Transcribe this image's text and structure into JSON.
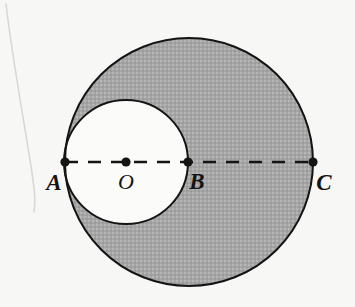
{
  "figure": {
    "background_color": "#f7f7f6",
    "stroke_color": "#141414",
    "shaded_fill_color": "#a8a8a8",
    "unshaded_fill_color": "#fbfbfa",
    "labels": {
      "a": "A",
      "o": "O",
      "b": "B",
      "c": "C"
    },
    "points": [
      {
        "name": "A",
        "label": "A",
        "x": 65,
        "y": 162,
        "role": "left-endpoint-of-diameter"
      },
      {
        "name": "O",
        "label": "O",
        "x": 126,
        "y": 162,
        "role": "center-of-small-circle"
      },
      {
        "name": "B",
        "label": "B",
        "x": 188,
        "y": 162,
        "role": "tangent-point-and-center-of-large-circle-offset"
      },
      {
        "name": "C",
        "label": "C",
        "x": 313,
        "y": 162,
        "role": "right-endpoint-of-diameter"
      }
    ],
    "circles": [
      {
        "name": "large-circle",
        "center_x": 189,
        "center_y": 162,
        "radius": 124,
        "fill": "#a8a8a8",
        "stroke_width": 2
      },
      {
        "name": "small-circle",
        "center_x": 126,
        "center_y": 162,
        "radius": 62,
        "fill": "#fbfbfa",
        "stroke_width": 2
      }
    ],
    "diameter_line": {
      "name": "dashed-diameter-AC",
      "x1": 65,
      "y1": 162,
      "x2": 313,
      "y2": 162,
      "dash_length": 13,
      "gap_length": 10,
      "stroke_width": 2.4
    },
    "dot_radius": 4.6,
    "label_positions": {
      "a": {
        "x": 54,
        "y": 190
      },
      "o": {
        "x": 126,
        "y": 189
      },
      "b": {
        "x": 197,
        "y": 189
      },
      "c": {
        "x": 324,
        "y": 190
      }
    },
    "scan_artifact": {
      "name": "page-edge-curve",
      "path": "M 6 4 C 12 55, 22 110, 30 160 C 34 185, 36 200, 34 212",
      "stroke": "#d8d8d6",
      "stroke_width": 1.6
    }
  }
}
